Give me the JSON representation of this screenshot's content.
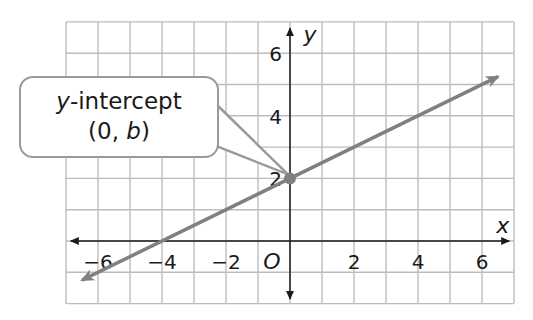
{
  "chart_data": {
    "type": "line",
    "title": "",
    "xlabel": "x",
    "ylabel": "y",
    "xlim": [
      -7,
      7
    ],
    "ylim": [
      -2,
      7
    ],
    "grid": true,
    "x_ticks": [
      -6,
      -4,
      -2,
      2,
      4,
      6
    ],
    "y_ticks": [
      2,
      4,
      6
    ],
    "origin_label": "O",
    "series": [
      {
        "name": "line",
        "equation": "y = 0.5x + 2",
        "x": [
          -6.5,
          -4,
          0,
          6.5
        ],
        "y": [
          -1.25,
          0,
          2,
          5.25
        ],
        "color": "#808080",
        "arrows": "both"
      }
    ],
    "points": [
      {
        "x": 0,
        "y": 2,
        "label": "y-intercept (0, b)"
      }
    ],
    "annotations": [
      {
        "text_italic": "y",
        "text": "-intercept",
        "line2_prefix": "(0, ",
        "line2_italic": "b",
        "line2_suffix": ")",
        "points_to": [
          0,
          2
        ]
      }
    ]
  },
  "labels": {
    "x_ticks": [
      "−6",
      "−4",
      "−2",
      "2",
      "4",
      "6"
    ],
    "y_ticks": [
      "2",
      "4",
      "6"
    ],
    "origin": "O",
    "x_axis": "x",
    "y_axis": "y",
    "callout_italic": "y",
    "callout_rest": "-intercept",
    "callout_line2_a": "(0, ",
    "callout_line2_b": "b",
    "callout_line2_c": ")"
  },
  "colors": {
    "grid": "#bdbdbd",
    "axis": "#1a1a1a",
    "line": "#808080",
    "callout_border": "#9a9a9a"
  }
}
